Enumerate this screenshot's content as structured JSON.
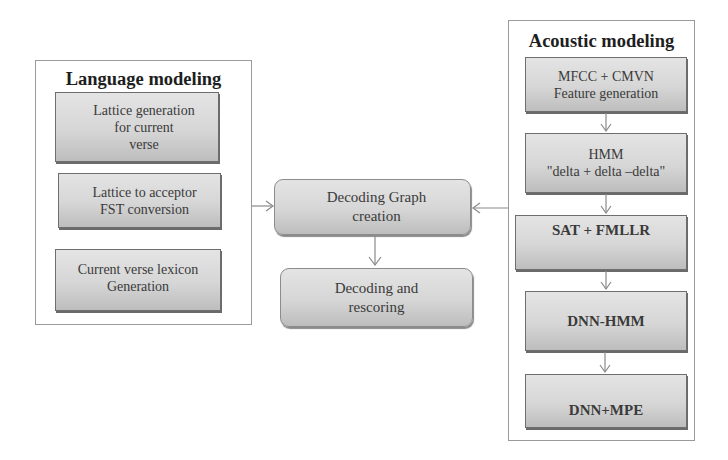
{
  "language_modeling": {
    "title": "Language modeling",
    "steps": [
      {
        "label": "Lattice generation\nfor current\nverse"
      },
      {
        "label": "Lattice to acceptor\nFST conversion"
      },
      {
        "label": "Current verse lexicon\nGeneration"
      }
    ]
  },
  "decoding": {
    "steps": [
      {
        "label": "Decoding Graph\ncreation"
      },
      {
        "label": "Decoding and\nrescoring"
      }
    ]
  },
  "acoustic_modeling": {
    "title": "Acoustic modeling",
    "steps": [
      {
        "label": "MFCC + CMVN\nFeature generation"
      },
      {
        "label": "HMM\n\"delta + delta –delta\""
      },
      {
        "label": "SAT + FMLLR"
      },
      {
        "label": "DNN-HMM"
      },
      {
        "label": "DNN+MPE"
      }
    ]
  },
  "colors": {
    "border": "#9a9a9a",
    "box_fill_top": "#e4e4e4",
    "box_fill_bottom": "#bdbdbd",
    "arrow": "#8a8a8a",
    "text": "#333333"
  }
}
